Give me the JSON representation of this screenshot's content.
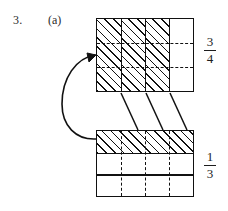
{
  "question": {
    "number": "3.",
    "part": "(a)"
  },
  "top_model": {
    "fraction": {
      "numerator": "3",
      "denominator": "4"
    },
    "columns_total": 4,
    "columns_shaded": 3,
    "row_divisions": 3,
    "column_divider_style": "solid",
    "row_divider_style": "dashed",
    "shading": "diagonal-hatch"
  },
  "bottom_model": {
    "fraction": {
      "numerator": "1",
      "denominator": "3"
    },
    "rows_total": 3,
    "rows_shaded": 1,
    "column_divisions": 4,
    "row_divider_style": "solid",
    "column_divider_style": "dashed",
    "shading": "diagonal-hatch"
  },
  "annotations": {
    "connector_count": 3,
    "connector_style": "solid-diagonal",
    "curved_arrow": "curved-arrow-bottom-to-top"
  },
  "colors": {
    "ink": "#111111",
    "paper": "#ffffff"
  }
}
